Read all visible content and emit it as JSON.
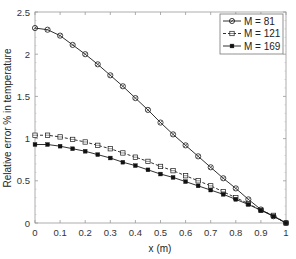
{
  "chart_data": {
    "type": "line",
    "title": "",
    "xlabel": "x (m)",
    "ylabel": "Relative error % in temperature",
    "xlim": [
      0,
      1
    ],
    "ylim": [
      0,
      2.5
    ],
    "xticks": [
      0,
      0.1,
      0.2,
      0.3,
      0.4,
      0.5,
      0.6,
      0.7,
      0.8,
      0.9,
      1
    ],
    "xtick_labels": [
      "0",
      "0.1",
      "0.2",
      "0.3",
      "0.4",
      "0.5",
      "0.6",
      "0.7",
      "0.8",
      "0.9",
      "1"
    ],
    "yticks": [
      0,
      0.5,
      1,
      1.5,
      2,
      2.5
    ],
    "ytick_labels": [
      "0",
      "0.5",
      "1",
      "1.5",
      "2",
      "2.5"
    ],
    "grid": false,
    "legend_position": "top-right",
    "x": [
      0,
      0.05,
      0.1,
      0.15,
      0.2,
      0.25,
      0.3,
      0.35,
      0.4,
      0.45,
      0.5,
      0.55,
      0.6,
      0.65,
      0.7,
      0.75,
      0.8,
      0.85,
      0.9,
      0.95,
      1
    ],
    "series": [
      {
        "name": "M = 81",
        "line_style": "solid",
        "marker": "circle-open",
        "color": "#1a1a1a",
        "values": [
          2.31,
          2.29,
          2.22,
          2.11,
          2.0,
          1.88,
          1.75,
          1.62,
          1.48,
          1.34,
          1.19,
          1.05,
          0.92,
          0.79,
          0.66,
          0.53,
          0.41,
          0.28,
          0.16,
          0.08,
          0
        ]
      },
      {
        "name": "M = 121",
        "line_style": "dashed",
        "marker": "square-open",
        "color": "#1a1a1a",
        "values": [
          1.04,
          1.04,
          1.02,
          0.99,
          0.96,
          0.92,
          0.88,
          0.83,
          0.78,
          0.73,
          0.67,
          0.62,
          0.56,
          0.5,
          0.44,
          0.37,
          0.3,
          0.23,
          0.15,
          0.09,
          0
        ]
      },
      {
        "name": "M = 169",
        "line_style": "solid",
        "marker": "dot-filled",
        "color": "#1a1a1a",
        "values": [
          0.93,
          0.93,
          0.91,
          0.88,
          0.85,
          0.81,
          0.77,
          0.72,
          0.68,
          0.63,
          0.58,
          0.54,
          0.49,
          0.44,
          0.39,
          0.34,
          0.28,
          0.22,
          0.15,
          0.08,
          0
        ]
      }
    ]
  }
}
